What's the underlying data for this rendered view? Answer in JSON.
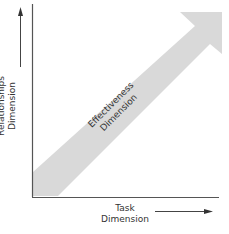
{
  "diagram": {
    "y_axis_label_line1": "Relationships",
    "y_axis_label_line2": "Dimension",
    "x_axis_label_line1": "Task",
    "x_axis_label_line2": "Dimension",
    "band_label_line1": "Effectiveness",
    "band_label_line2": "Dimension",
    "colors": {
      "axis": "#555555",
      "band": "#d9d9d9",
      "text": "#333333"
    }
  }
}
